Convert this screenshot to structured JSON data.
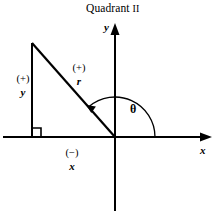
{
  "figure": {
    "title_text": "Quadrant",
    "title_numeral": "II",
    "background_color": "#ffffff",
    "stroke_color": "#000000"
  },
  "axes": {
    "y_label": "y",
    "x_label": "x",
    "origin": {
      "x": 115,
      "y": 137
    },
    "y_axis": {
      "top": 24,
      "bottom": 211,
      "x": 115,
      "arrow": "up"
    },
    "x_axis": {
      "left": 3,
      "right": 212,
      "y": 137,
      "arrow": "right"
    }
  },
  "triangle": {
    "apex": {
      "x": 32,
      "y": 43
    },
    "right_angle_vertex": {
      "x": 32,
      "y": 137
    },
    "origin_vertex": {
      "x": 115,
      "y": 137
    },
    "right_angle_marker_size": 9
  },
  "labels": {
    "vertical_leg": {
      "sign": "(+)",
      "var": "y"
    },
    "hypotenuse": {
      "sign": "(+)",
      "var": "r"
    },
    "horizontal_leg": {
      "sign": "(−)",
      "var": "x"
    },
    "angle": "θ"
  },
  "angle_arc": {
    "radius": 40,
    "start_degrees": 0,
    "end_degrees": 131,
    "direction": "counterclockwise",
    "arrowhead_at": "end"
  }
}
